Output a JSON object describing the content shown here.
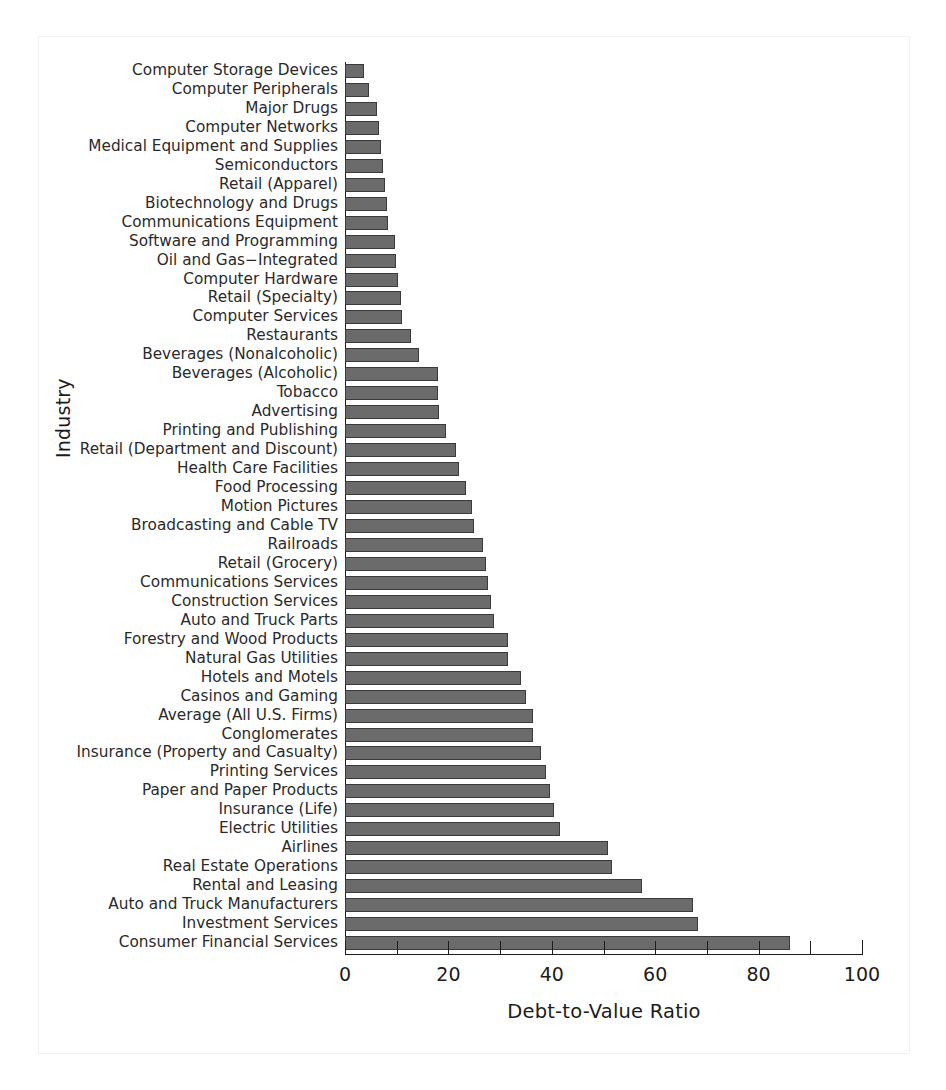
{
  "chart_data": {
    "type": "bar",
    "orientation": "horizontal",
    "title": "",
    "xlabel": "Debt-to-Value Ratio",
    "ylabel": "Industry",
    "xlim": [
      0,
      100
    ],
    "xticks": [
      0,
      20,
      40,
      60,
      80,
      100
    ],
    "xtick_labels": [
      "0",
      "20",
      "40",
      "60",
      "80",
      "100"
    ],
    "xminorticks": [
      10,
      30,
      50,
      70,
      90
    ],
    "grid": false,
    "legend": null,
    "bar_color": "#6b6b6b",
    "bar_edge_color": "#3a3a3a",
    "categories": [
      "Computer Storage Devices",
      "Computer Peripherals",
      "Major Drugs",
      "Computer Networks",
      "Medical Equipment and Supplies",
      "Semiconductors",
      "Retail (Apparel)",
      "Biotechnology and Drugs",
      "Communications Equipment",
      "Software and Programming",
      "Oil and Gas−Integrated",
      "Computer Hardware",
      "Retail (Specialty)",
      "Computer Services",
      "Restaurants",
      "Beverages (Nonalcoholic)",
      "Beverages (Alcoholic)",
      "Tobacco",
      "Advertising",
      "Printing and Publishing",
      "Retail (Department and Discount)",
      "Health Care Facilities",
      "Food Processing",
      "Motion Pictures",
      "Broadcasting and Cable TV",
      "Railroads",
      "Retail (Grocery)",
      "Communications Services",
      "Construction Services",
      "Auto and Truck Parts",
      "Forestry and Wood Products",
      "Natural Gas Utilities",
      "Hotels and Motels",
      "Casinos and Gaming",
      "Average (All U.S. Firms)",
      "Conglomerates",
      "Insurance (Property and Casualty)",
      "Printing Services",
      "Paper and Paper Products",
      "Insurance (Life)",
      "Electric Utilities",
      "Airlines",
      "Real Estate Operations",
      "Rental and Leasing",
      "Auto and Truck Manufacturers",
      "Investment Services",
      "Consumer Financial Services"
    ],
    "values": [
      3.6,
      4.6,
      6.2,
      6.5,
      6.9,
      7.4,
      7.7,
      8.2,
      8.3,
      9.6,
      9.8,
      10.2,
      10.8,
      11.0,
      12.8,
      14.3,
      17.9,
      17.9,
      18.1,
      19.6,
      21.4,
      22.0,
      23.5,
      24.6,
      25.0,
      26.7,
      27.2,
      27.6,
      28.2,
      28.8,
      31.5,
      31.6,
      34.1,
      35.0,
      36.3,
      36.4,
      38.0,
      38.8,
      39.6,
      40.4,
      41.5,
      50.8,
      51.6,
      57.4,
      67.4,
      68.2,
      86.0
    ]
  },
  "axes": {
    "x_title": "Debt-to-Value Ratio",
    "y_title": "Industry"
  }
}
